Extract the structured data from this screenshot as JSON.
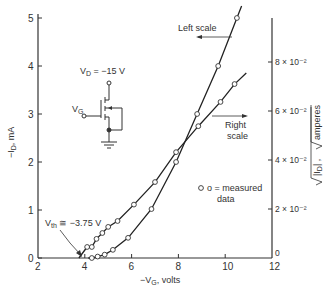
{
  "chart_data": {
    "type": "line",
    "title": "",
    "xlabel": "-V_G, volts",
    "ylabel_left": "-I_D, mA",
    "ylabel_right": "sqrt(|I_D|), sqrt(amperes)",
    "xlim": [
      2,
      12
    ],
    "ylim_left": [
      0,
      5
    ],
    "ylim_right": [
      0,
      0.098
    ],
    "x_ticks": [
      "2",
      "4",
      "6",
      "8",
      "10",
      "12"
    ],
    "y_ticks_left": [
      "0",
      "1",
      "2",
      "3",
      "4",
      "5"
    ],
    "y_ticks_right": [
      "0",
      "2 × 10⁻²",
      "4 × 10⁻²",
      "6 × 10⁻²",
      "8 × 10⁻²"
    ],
    "grid": false,
    "series": [
      {
        "name": "Left scale",
        "axis": "left",
        "marker": "open-circle",
        "x": [
          4.3,
          4.55,
          4.85,
          5.2,
          5.85,
          6.85,
          7.9,
          8.8,
          9.7,
          10.5
        ],
        "y": [
          0.0,
          0.03,
          0.07,
          0.17,
          0.42,
          1.02,
          2.0,
          3.0,
          4.0,
          5.0
        ]
      },
      {
        "name": "Right scale",
        "axis": "right",
        "marker": "open-circle",
        "x": [
          4.1,
          4.3,
          4.5,
          4.75,
          5.0,
          5.4,
          6.1,
          7.0,
          7.9,
          8.85,
          9.8,
          10.4
        ],
        "y": [
          0.0045,
          0.0045,
          0.0078,
          0.0102,
          0.0127,
          0.0151,
          0.0218,
          0.031,
          0.0432,
          0.0538,
          0.0637,
          0.071
        ]
      }
    ],
    "annotations": [
      {
        "text": "Left scale",
        "arrow": "left"
      },
      {
        "text": "Right scale",
        "arrow": "right"
      },
      {
        "text": "o = measured data"
      },
      {
        "text": "V_th ≅ -3.75 V",
        "x": 3.75,
        "y": 0
      }
    ],
    "inset_circuit": {
      "drain_label": "V_D = -15 V",
      "gate_label": "V_G"
    }
  },
  "labels": {
    "left_scale": "Left scale",
    "right_scale_1": "Right",
    "right_scale_2": "scale",
    "legend_1": "o = measured",
    "legend_2": "data",
    "vth": "V",
    "vth_sub": "th",
    "vth_val": " ≅ −3.75 V",
    "vd": "V",
    "vd_sub": "D",
    "vd_val": " = −15 V",
    "vg": "V",
    "vg_sub": "G",
    "xlabel": "−V",
    "xlabel_sub": "G",
    "xlabel_tail": ", volts",
    "ylabel_left": "−I",
    "ylabel_left_sub": "D",
    "ylabel_left_tail": ", mA",
    "ylabel_right_a": "|I",
    "ylabel_right_sub": "D",
    "ylabel_right_b": "| ,  ",
    "ylabel_right_c": "amperes"
  }
}
